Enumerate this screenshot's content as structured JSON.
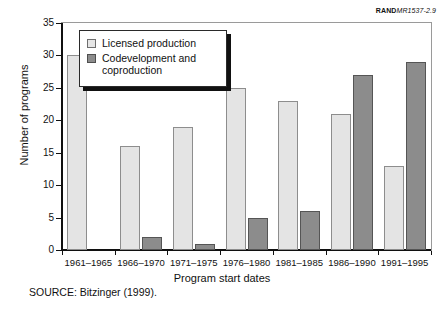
{
  "figure": {
    "rand_label_bold": "RAND",
    "rand_label_italic": "MR1537-2.9",
    "source_note": "SOURCE:  Bitzinger (1999)."
  },
  "legend": {
    "items": [
      {
        "label": "Licensed production",
        "color": "#e4e4e4"
      },
      {
        "label": "Codevelopment and coproduction",
        "color": "#8c8c8c"
      }
    ]
  },
  "chart_data": {
    "type": "bar",
    "title": "",
    "xlabel": "Program start dates",
    "ylabel": "Number of programs",
    "categories": [
      "1961–1965",
      "1966–1970",
      "1971–1975",
      "1976–1980",
      "1981–1985",
      "1986–1990",
      "1991–1995"
    ],
    "series": [
      {
        "name": "Licensed production",
        "color": "#e4e4e4",
        "values": [
          30,
          16,
          19,
          25,
          23,
          21,
          13
        ]
      },
      {
        "name": "Codevelopment and coproduction",
        "color": "#8c8c8c",
        "values": [
          0,
          2,
          1,
          5,
          6,
          27,
          29
        ]
      }
    ],
    "ylim": [
      0,
      35
    ],
    "ytick_labels": [
      "0",
      "5",
      "10",
      "15",
      "20",
      "25",
      "30",
      "35"
    ],
    "ytick_values": [
      0,
      5,
      10,
      15,
      20,
      25,
      30,
      35
    ],
    "grid": false,
    "legend_position": "upper-left-inside"
  }
}
